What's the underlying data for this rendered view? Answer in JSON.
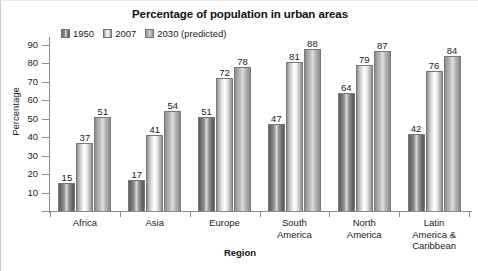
{
  "chart_data": {
    "type": "bar",
    "title": "Percentage of population in urban areas",
    "xlabel": "Region",
    "ylabel": "Percentage",
    "categories": [
      "Africa",
      "Asia",
      "Europe",
      "South America",
      "North America",
      "Latin America & Caribbean"
    ],
    "category_lines": [
      [
        "Africa"
      ],
      [
        "Asia"
      ],
      [
        "Europe"
      ],
      [
        "South",
        "America"
      ],
      [
        "North",
        "America"
      ],
      [
        "Latin",
        "America &",
        "Caribbean"
      ]
    ],
    "series": [
      {
        "name": "1950",
        "values": [
          15,
          17,
          51,
          47,
          64,
          42
        ],
        "color": "#6f6f6f"
      },
      {
        "name": "2007",
        "values": [
          37,
          41,
          72,
          81,
          79,
          76
        ],
        "color": "#ffffff"
      },
      {
        "name": "2030 (predicted)",
        "values": [
          51,
          54,
          78,
          88,
          87,
          84
        ],
        "color": "#b4b4b4"
      }
    ],
    "ylim": [
      0,
      90
    ],
    "yticks": [
      10,
      20,
      30,
      40,
      50,
      60,
      70,
      80,
      90
    ],
    "ytick_labels": [
      "10",
      "20",
      "30",
      "40",
      "50",
      "60",
      "70",
      "80",
      "90"
    ],
    "grid": false,
    "legend_position": "top-left-inside",
    "legend_entries": [
      "1950",
      "2007",
      "2030 (predicted)"
    ]
  }
}
